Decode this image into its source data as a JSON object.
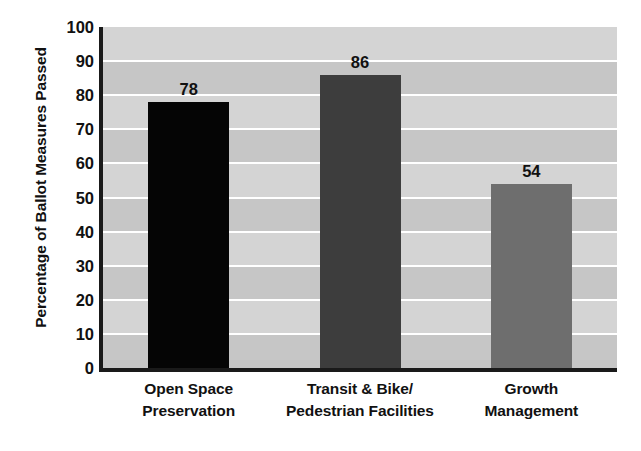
{
  "chart_data": {
    "type": "bar",
    "title": "",
    "subtitle": "",
    "xlabel": "",
    "ylabel": "Percentage of Ballot Measures Passed",
    "ylim": [
      0,
      100
    ],
    "ytick_interval": 10,
    "yticks": [
      "100",
      "90",
      "80",
      "70",
      "60",
      "50",
      "40",
      "30",
      "20",
      "10",
      "0"
    ],
    "grid": true,
    "legend": false,
    "legend_position": "none",
    "categories": [
      "Open Space Preservation",
      "Transit & Bike/ Pedestrian Facilities",
      "Growth Management"
    ],
    "values": [
      78,
      86,
      54
    ],
    "value_labels": [
      "78",
      "86",
      "54"
    ],
    "bar_colors": [
      "#050505",
      "#3d3d3d",
      "#6e6e6e"
    ],
    "bars": [
      {
        "category_line1": "Open Space",
        "category_line2": "Preservation",
        "value": 78,
        "value_label": "78",
        "color": "#050505"
      },
      {
        "category_line1": "Transit & Bike/",
        "category_line2": "Pedestrian Facilities",
        "value": 86,
        "value_label": "86",
        "color": "#3d3d3d"
      },
      {
        "category_line1": "Growth",
        "category_line2": "Management",
        "value": 54,
        "value_label": "54",
        "color": "#6e6e6e"
      }
    ],
    "style": {
      "plot_background": "#cccccc",
      "band_light": "#d4d4d4",
      "band_dark": "#c6c6c6",
      "gridline_color": "#ffffff",
      "axis_color": "#1a1a1a",
      "text_color": "#111111",
      "figure_background": "#ffffff"
    }
  }
}
